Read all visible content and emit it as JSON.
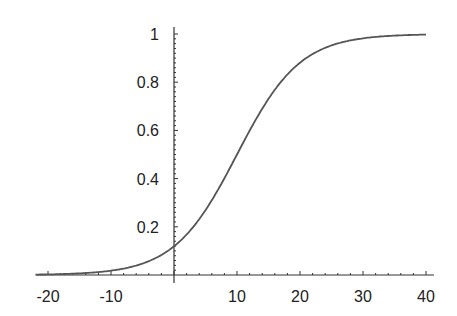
{
  "chart_data": {
    "type": "line",
    "title": "",
    "xlabel": "",
    "ylabel": "",
    "xlim": [
      -22,
      41
    ],
    "ylim": [
      0,
      1.02
    ],
    "grid": false,
    "legend": null,
    "x_ticks": [
      -20,
      -10,
      10,
      20,
      30,
      40
    ],
    "x_tick_labels": [
      "-20",
      "-10",
      "10",
      "20",
      "30",
      "40"
    ],
    "y_ticks": [
      0.2,
      0.4,
      0.6,
      0.8,
      1
    ],
    "y_tick_labels": [
      "0.2",
      "0.4",
      "0.6",
      "0.8",
      "1"
    ],
    "series": [
      {
        "name": "logistic curve",
        "description": "Sigmoid rising from ~0 to ~1, midpoint near x=10, y≈0.12 at x=0",
        "x": [
          -20,
          -15,
          -10,
          -5,
          0,
          5,
          10,
          15,
          20,
          25,
          30,
          35,
          40
        ],
        "values": [
          0.002,
          0.007,
          0.018,
          0.047,
          0.119,
          0.269,
          0.5,
          0.731,
          0.881,
          0.953,
          0.982,
          0.993,
          0.998
        ]
      }
    ],
    "line_color": "#555555",
    "axis_color": "#333333"
  }
}
